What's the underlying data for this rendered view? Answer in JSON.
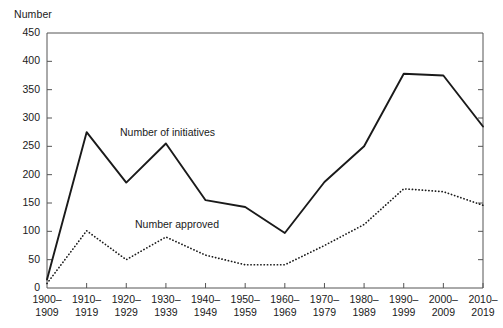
{
  "chart_data": {
    "type": "line",
    "title": "",
    "ylabel": "Number",
    "xlabel": "",
    "ylim": [
      0,
      450
    ],
    "ytick_step": 50,
    "grid": false,
    "legend_position": "inline-annotations",
    "categories": [
      "1900–1909",
      "1910–1919",
      "1920–1929",
      "1930–1939",
      "1940–1949",
      "1950–1959",
      "1960–1969",
      "1970–1979",
      "1980–1989",
      "1990–1999",
      "2000–2009",
      "2010–2019"
    ],
    "category_lines": [
      [
        "1900–",
        "1909"
      ],
      [
        "1910–",
        "1919"
      ],
      [
        "1920–",
        "1929"
      ],
      [
        "1930–",
        "1939"
      ],
      [
        "1940–",
        "1949"
      ],
      [
        "1950–",
        "1959"
      ],
      [
        "1960–",
        "1969"
      ],
      [
        "1970–",
        "1979"
      ],
      [
        "1980–",
        "1989"
      ],
      [
        "1990–",
        "1999"
      ],
      [
        "2000–",
        "2009"
      ],
      [
        "2010–",
        "2019"
      ]
    ],
    "yticks": [
      0,
      50,
      100,
      150,
      200,
      250,
      300,
      350,
      400,
      450
    ],
    "series": [
      {
        "name": "Number of initiatives",
        "style": "solid",
        "color": "#1a1a1a",
        "values": [
          15,
          275,
          186,
          255,
          155,
          143,
          97,
          187,
          250,
          378,
          375,
          285
        ]
      },
      {
        "name": "Number approved",
        "style": "dotted",
        "color": "#1a1a1a",
        "values": [
          8,
          101,
          50,
          90,
          58,
          41,
          41,
          75,
          112,
          175,
          170,
          146
        ]
      }
    ],
    "annotations": [
      {
        "text": "Number of initiatives",
        "series": "Number of initiatives"
      },
      {
        "text": "Number approved",
        "series": "Number approved"
      }
    ]
  },
  "axis": {
    "y_title": "Number"
  }
}
